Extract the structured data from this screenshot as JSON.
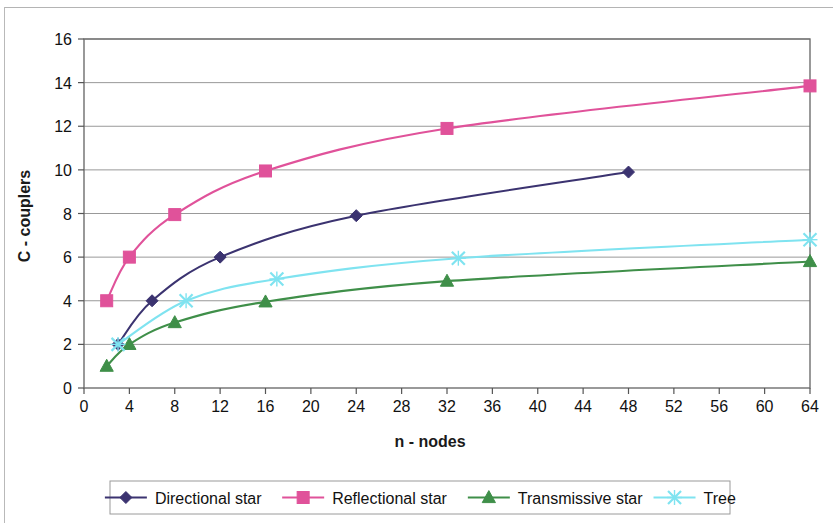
{
  "chart_data": {
    "type": "line",
    "title": "",
    "xlabel": "n - nodes",
    "ylabel": "C - couplers",
    "xlim": [
      0,
      64
    ],
    "ylim": [
      0,
      16
    ],
    "xticks": [
      0,
      4,
      8,
      12,
      16,
      20,
      24,
      28,
      32,
      36,
      40,
      44,
      48,
      52,
      56,
      60,
      64
    ],
    "yticks": [
      0,
      2,
      4,
      6,
      8,
      10,
      12,
      14,
      16
    ],
    "xtick_labels": [
      "0",
      "4",
      "8",
      "12",
      "16",
      "20",
      "24",
      "28",
      "32",
      "36",
      "40",
      "44",
      "48",
      "52",
      "56",
      "60",
      "64"
    ],
    "ytick_labels": [
      "0",
      "2",
      "4",
      "6",
      "8",
      "10",
      "12",
      "14",
      "16"
    ],
    "grid": "horizontal",
    "legend_position": "bottom",
    "series": [
      {
        "name": "Directional star",
        "color": "#3b3370",
        "marker": "diamond",
        "x": [
          3,
          6,
          12,
          24,
          48
        ],
        "y": [
          2.0,
          4.0,
          6.0,
          7.9,
          9.9
        ]
      },
      {
        "name": "Reflectional star",
        "color": "#e0529a",
        "marker": "square",
        "x": [
          2,
          4,
          8,
          16,
          32,
          64
        ],
        "y": [
          4.0,
          6.0,
          7.95,
          9.95,
          11.9,
          13.85
        ]
      },
      {
        "name": "Transmissive star",
        "color": "#3f8f49",
        "marker": "triangle",
        "x": [
          2,
          4,
          8,
          16,
          32,
          64
        ],
        "y": [
          1.0,
          2.0,
          3.0,
          3.95,
          4.9,
          5.8
        ]
      },
      {
        "name": "Tree",
        "color": "#7fe3f0",
        "marker": "cross",
        "x": [
          3,
          9,
          17,
          33,
          64
        ],
        "y": [
          2.0,
          4.0,
          5.0,
          5.95,
          6.8
        ]
      }
    ]
  },
  "legend": {
    "items": [
      {
        "label": "Directional star",
        "color": "#3b3370",
        "marker": "diamond"
      },
      {
        "label": "Reflectional star",
        "color": "#e0529a",
        "marker": "square"
      },
      {
        "label": "Transmissive star",
        "color": "#3f8f49",
        "marker": "triangle"
      },
      {
        "label": "Tree",
        "color": "#7fe3f0",
        "marker": "cross"
      }
    ]
  }
}
